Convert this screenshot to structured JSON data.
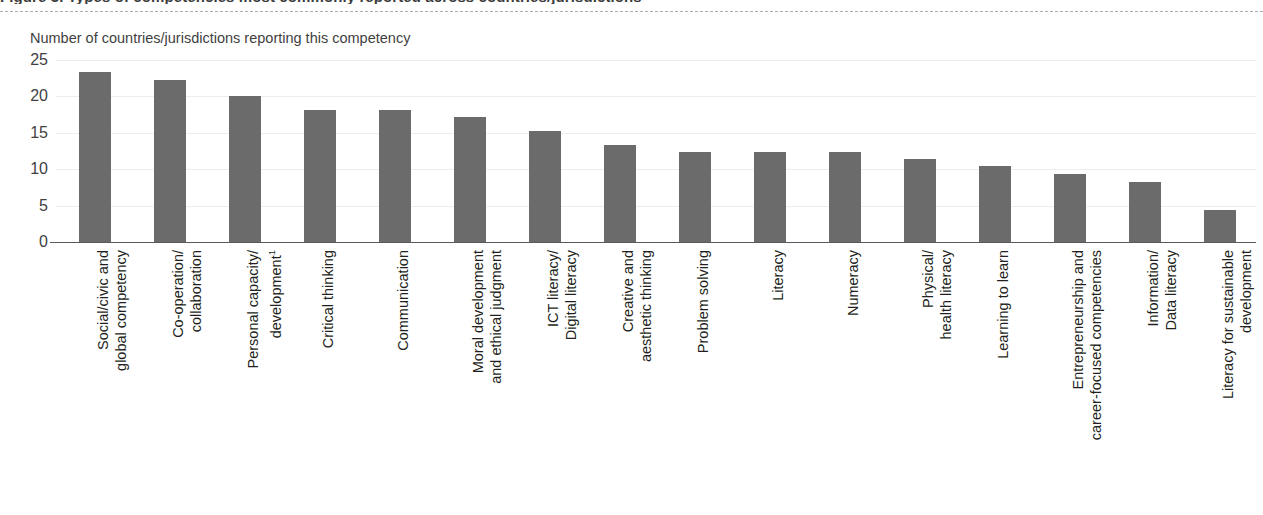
{
  "figure": {
    "title": "Figure 3. Types of competencies most commonly reported across countries/jurisdictions",
    "y_axis_title": "Number of countries/jurisdictions reporting this competency",
    "bar_color": "#6b6b6b",
    "gridline_color": "#ededed",
    "axis_color": "#5a5a5a"
  },
  "chart_data": {
    "type": "bar",
    "title": "Figure 3. Types of competencies most commonly reported across countries/jurisdictions",
    "xlabel": "",
    "ylabel": "Number of countries/jurisdictions reporting this competency",
    "ylim": [
      0,
      25
    ],
    "yticks": [
      0,
      5,
      10,
      15,
      20,
      25
    ],
    "grid": true,
    "legend": "none",
    "orientation": "vertical",
    "categories": [
      "Social/civic and global competency",
      "Co-operation/ collaboration",
      "Personal capacity/ development¹",
      "Critical thinking",
      "Communication",
      "Moral development and ethical judgment",
      "ICT literacy/ Digital literacy",
      "Creative and aesthetic thinking",
      "Problem solving",
      "Literacy",
      "Numeracy",
      "Physical/ health literacy",
      "Learning to learn",
      "Entrepreneurship and career-focused competencies",
      "Information/ Data literacy",
      "Literacy for sustainable development"
    ],
    "values": [
      23.3,
      22.2,
      20.1,
      18.1,
      18.1,
      17.2,
      15.3,
      13.3,
      12.4,
      12.4,
      12.4,
      11.4,
      10.4,
      9.3,
      8.2,
      4.4
    ]
  },
  "y_ticks": [
    {
      "label": "25",
      "value": 25
    },
    {
      "label": "20",
      "value": 20
    },
    {
      "label": "15",
      "value": 15
    },
    {
      "label": "10",
      "value": 10
    },
    {
      "label": "5",
      "value": 5
    },
    {
      "label": "0",
      "value": 0
    }
  ],
  "categories": [
    {
      "line1": "Social/civic and",
      "line2": "global competency",
      "value": 23.3
    },
    {
      "line1": "Co-operation/",
      "line2": "collaboration",
      "value": 22.2
    },
    {
      "line1": "Personal capacity/",
      "line2": "development",
      "sup": "1",
      "value": 20.1
    },
    {
      "line1": "Critical thinking",
      "line2": "",
      "value": 18.1
    },
    {
      "line1": "Communication",
      "line2": "",
      "value": 18.1
    },
    {
      "line1": "Moral development",
      "line2": "and ethical judgment",
      "value": 17.2
    },
    {
      "line1": "ICT literacy/",
      "line2": "Digital literacy",
      "value": 15.3
    },
    {
      "line1": "Creative and",
      "line2": "aesthetic thinking",
      "value": 13.3
    },
    {
      "line1": "Problem solving",
      "line2": "",
      "value": 12.4
    },
    {
      "line1": "Literacy",
      "line2": "",
      "value": 12.4
    },
    {
      "line1": "Numeracy",
      "line2": "",
      "value": 12.4
    },
    {
      "line1": "Physical/",
      "line2": "health literacy",
      "value": 11.4
    },
    {
      "line1": "Learning to learn",
      "line2": "",
      "value": 10.4
    },
    {
      "line1": "Entrepreneurship and",
      "line2": "career-focused competencies",
      "value": 9.3
    },
    {
      "line1": "Information/",
      "line2": "Data literacy",
      "value": 8.2
    },
    {
      "line1": "Literacy for sustainable",
      "line2": "development",
      "value": 4.4
    }
  ]
}
